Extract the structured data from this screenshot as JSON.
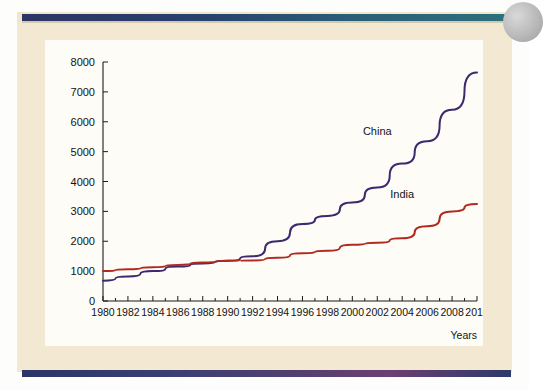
{
  "page": {
    "background_color": "#f3e9d2",
    "top_rule_color": "#2b3566",
    "bottom_rule_color": "#2c3566",
    "panel_color": "#fdfcf7"
  },
  "chart_data": {
    "type": "line",
    "title": "",
    "subtitle": "",
    "xlabel": "Years",
    "ylabel": "",
    "xlim": [
      1980,
      2010
    ],
    "ylim": [
      0,
      8000
    ],
    "grid": false,
    "legend_position": "inline-annotations",
    "x": [
      1980,
      1982,
      1984,
      1986,
      1988,
      1990,
      1992,
      1994,
      1996,
      1998,
      2000,
      2002,
      2004,
      2006,
      2008,
      2010
    ],
    "xticks": [
      "1980",
      "1982",
      "1984",
      "1986",
      "1988",
      "1990",
      "1992",
      "1994",
      "1996",
      "1998",
      "2000",
      "2002",
      "2004",
      "2006",
      "2008",
      "2010"
    ],
    "yticks": [
      "0",
      "1000",
      "2000",
      "3000",
      "4000",
      "5000",
      "6000",
      "7000",
      "8000"
    ],
    "ytick_values": [
      0,
      1000,
      2000,
      3000,
      4000,
      5000,
      6000,
      7000,
      8000
    ],
    "series": [
      {
        "name": "China",
        "color": "#3d2a6e",
        "label_x": 2002,
        "label_y": 5550,
        "values": [
          680,
          820,
          1000,
          1150,
          1260,
          1350,
          1500,
          2000,
          2580,
          2850,
          3300,
          3800,
          4600,
          5350,
          6400,
          7650
        ]
      },
      {
        "name": "India",
        "color": "#b02a20",
        "label_x": 2004,
        "label_y": 3450,
        "values": [
          1000,
          1060,
          1130,
          1210,
          1290,
          1350,
          1360,
          1450,
          1600,
          1680,
          1880,
          1950,
          2100,
          2500,
          3000,
          3250
        ]
      }
    ]
  }
}
